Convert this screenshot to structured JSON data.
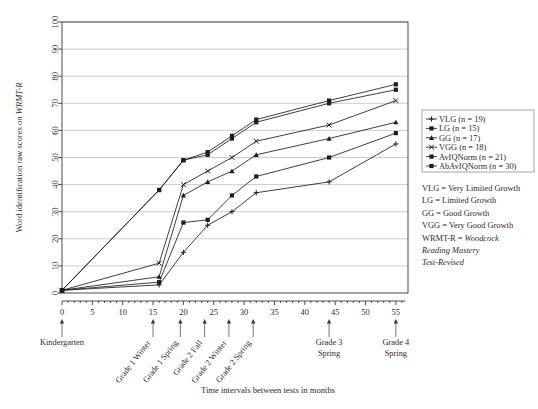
{
  "chart_data": {
    "type": "line",
    "title": "",
    "xlabel": "Time intervals between tests in months",
    "ylabel": "Word identification raw scores on WRMT-R",
    "ylabel_plain": "Word identification raw scores on ",
    "ylabel_italic": "WRMT-R",
    "xlim": [
      0,
      57
    ],
    "ylim": [
      0,
      100
    ],
    "grid": true,
    "legend_position": "right",
    "x_ticks": [
      0,
      5,
      10,
      15,
      20,
      25,
      30,
      35,
      40,
      45,
      50,
      55
    ],
    "y_ticks": [
      0,
      10,
      20,
      30,
      40,
      50,
      60,
      70,
      80,
      90,
      100
    ],
    "x": [
      0,
      16,
      20,
      24,
      28,
      32,
      44,
      55
    ],
    "series": [
      {
        "name": "VLG (n = 19)",
        "label": "VLG",
        "n": 19,
        "marker": "plus",
        "values": [
          1,
          3,
          15,
          25,
          30,
          37,
          41,
          55
        ]
      },
      {
        "name": "LG (n = 15)",
        "label": "LG",
        "n": 15,
        "marker": "square",
        "values": [
          1,
          4,
          26,
          27,
          36,
          43,
          50,
          59
        ]
      },
      {
        "name": "GG (n = 17)",
        "label": "GG",
        "n": 17,
        "marker": "triangle",
        "values": [
          1,
          6,
          36,
          41,
          45,
          51,
          57,
          63
        ]
      },
      {
        "name": "VGG (n = 18)",
        "label": "VGG",
        "n": 18,
        "marker": "x",
        "values": [
          1,
          11,
          40,
          45,
          50,
          56,
          62,
          71
        ]
      },
      {
        "name": "AvIQNorm (n = 21)",
        "label": "AvIQNorm",
        "n": 21,
        "marker": "square",
        "values": [
          1,
          38,
          49,
          51,
          57,
          63,
          70,
          75
        ]
      },
      {
        "name": "AbAvIQNorm (n = 30)",
        "label": "AbAvIQNorm",
        "n": 30,
        "marker": "square",
        "values": [
          1,
          38,
          49,
          52,
          58,
          64,
          71,
          77
        ]
      }
    ],
    "annotations": [
      {
        "label": "Kindergarten",
        "x": 0,
        "lines": [
          "Kindergarten"
        ],
        "rotated": false
      },
      {
        "label": "Grade 1 Winter",
        "x": 15,
        "lines": [
          "Grade 1 Winter"
        ],
        "rotated": true
      },
      {
        "label": "Grade 1 Spring",
        "x": 19.5,
        "lines": [
          "Grade 1 Spring"
        ],
        "rotated": true
      },
      {
        "label": "Grade 2 Fall",
        "x": 23.5,
        "lines": [
          "Grade 2 Fall"
        ],
        "rotated": true
      },
      {
        "label": "Grade 2 Winter",
        "x": 27.5,
        "lines": [
          "Grade 2 Winter"
        ],
        "rotated": true
      },
      {
        "label": "Grade 2 Spring",
        "x": 31.5,
        "lines": [
          "Grade 2 Spring"
        ],
        "rotated": true
      },
      {
        "label": "Grade 3 Spring",
        "x": 44,
        "lines": [
          "Grade 3",
          "Spring"
        ],
        "rotated": false
      },
      {
        "label": "Grade 4 Spring",
        "x": 55,
        "lines": [
          "Grade 4",
          "Spring"
        ],
        "rotated": false
      }
    ]
  },
  "legend": {
    "entries": [
      "VLG (n = 19)",
      "LG (n = 15)",
      "GG (n = 17)",
      "VGG (n = 18)",
      "AvIQNorm (n = 21)",
      "AbAvIQNorm (n = 30)"
    ]
  },
  "key": {
    "lines": [
      {
        "text": "VLG = Very Limited Growth",
        "italic": false
      },
      {
        "text": "LG = Limited Growth",
        "italic": false
      },
      {
        "text": "GG = Good Growth",
        "italic": false
      },
      {
        "text": "VGG = Very Good Growth",
        "italic": false
      }
    ],
    "wrmt_prefix": "WRMT-R = ",
    "wrmt_italic_1": "Woodcock",
    "wrmt_italic_2": "Reading Mastery",
    "wrmt_italic_3": "Test-Revised"
  },
  "colors": {
    "line": "#1d1d1d",
    "grid": "#a9a9a9",
    "frame": "#3a3a3a",
    "text": "#2b2b2b",
    "background": "#ffffff"
  }
}
